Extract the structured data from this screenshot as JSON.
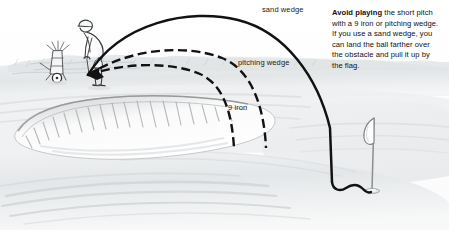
{
  "illustration": {
    "title": "Golf short pitch over bunker — club trajectory comparison",
    "media": "pencil-and-ink instructional drawing",
    "canvas": {
      "width": 449,
      "height": 230
    },
    "background_color": "#ffffff",
    "ink_color": "#111111",
    "pencil_shade_color": "#d8dadb"
  },
  "callout": {
    "lead": "Avoid playing",
    "body": " the short pitch with a 9 iron or pitching wedge. If you use a sand wedge, you can land the ball farther over the obstacle and pull it up by the flag."
  },
  "trajectories": [
    {
      "id": "sand-wedge",
      "label": "sand wedge",
      "style": "solid",
      "outcome": "carries the bunker, lands near the flag and checks up",
      "label_position": {
        "x": 262,
        "y": 6
      }
    },
    {
      "id": "pitching-wedge",
      "label": "pitching wedge",
      "style": "dashed",
      "outcome": "falls short into the bunker",
      "label_position": {
        "x": 238,
        "y": 59
      }
    },
    {
      "id": "nine-iron",
      "label": "9 iron",
      "style": "dashed",
      "outcome": "falls shortest, into the bunker",
      "label_position": {
        "x": 228,
        "y": 104
      }
    }
  ],
  "scene_objects": [
    {
      "id": "golfer",
      "label": "golfer at address"
    },
    {
      "id": "golf-bag-cart",
      "label": "golf bag on pull cart"
    },
    {
      "id": "ball-origin",
      "label": "ball position / trajectory origin"
    },
    {
      "id": "bunker",
      "label": "bunker obstacle"
    },
    {
      "id": "flagstick",
      "label": "flagstick with flag"
    },
    {
      "id": "green",
      "label": "putting green"
    },
    {
      "id": "treeline",
      "label": "background treeline"
    }
  ]
}
